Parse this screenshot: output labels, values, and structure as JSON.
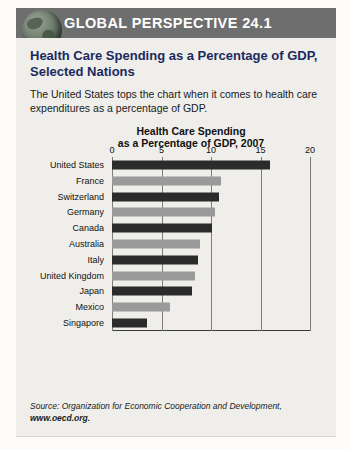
{
  "header": {
    "title": "GLOBAL PERSPECTIVE 24.1",
    "icon": "globe-icon",
    "bar_color": "#6e6e6e"
  },
  "article": {
    "headline": "Health Care Spending as a Percentage of GDP, Selected Nations",
    "intro": "The United States tops the chart when it comes to health care expenditures as a percentage of GDP.",
    "headline_color": "#1b2a5e"
  },
  "source": {
    "line1": "Source: Organization for Economic Cooperation and Development,",
    "line2": "www.oecd.org."
  },
  "chart_data": {
    "type": "bar",
    "orientation": "horizontal",
    "title": "Health Care Spending as a Percentage of GDP, 2007",
    "title_line1": "Health Care Spending",
    "title_line2": "as a Percentage of GDP, 2007",
    "xlabel": "",
    "ylabel": "",
    "xlim": [
      0,
      20
    ],
    "xticks": [
      0,
      5,
      10,
      15,
      20
    ],
    "grid": true,
    "legend": "none",
    "bar_colors": [
      "#2b2b2b",
      "#9a9a9a"
    ],
    "categories": [
      "United States",
      "France",
      "Switzerland",
      "Germany",
      "Canada",
      "Australia",
      "Italy",
      "United Kingdom",
      "Japan",
      "Mexico",
      "Singapore"
    ],
    "values": [
      16.0,
      11.0,
      10.8,
      10.4,
      10.1,
      8.9,
      8.7,
      8.4,
      8.1,
      5.9,
      3.5
    ]
  }
}
